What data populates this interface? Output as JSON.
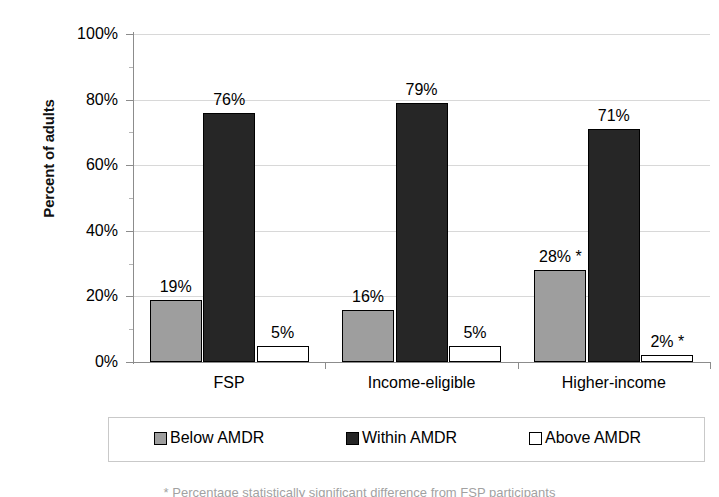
{
  "chart_data": {
    "type": "bar",
    "title": "",
    "xlabel": "",
    "ylabel": "Percent of adults",
    "ylim": [
      0,
      100
    ],
    "ytick_labels": [
      "0%",
      "20%",
      "40%",
      "60%",
      "80%",
      "100%"
    ],
    "ytick_values": [
      0,
      20,
      40,
      60,
      80,
      100
    ],
    "grid": true,
    "legend_position": "bottom",
    "categories": [
      "FSP",
      "Income-eligible",
      "Higher-income"
    ],
    "series": [
      {
        "name": "Below AMDR",
        "color": "#9e9e9e",
        "values": [
          19,
          16,
          28
        ],
        "labels": [
          "19%",
          "16%",
          "28% *"
        ]
      },
      {
        "name": "Within AMDR",
        "color": "#262626",
        "values": [
          76,
          79,
          71
        ],
        "labels": [
          "76%",
          "79%",
          "71%"
        ]
      },
      {
        "name": "Above AMDR",
        "color": "#ffffff",
        "values": [
          5,
          5,
          2
        ],
        "labels": [
          "5%",
          "5%",
          "2% *"
        ]
      }
    ]
  },
  "legend": {
    "items": [
      {
        "label": "Below AMDR"
      },
      {
        "label": "Within AMDR"
      },
      {
        "label": "Above AMDR"
      }
    ]
  },
  "footnote": {
    "text": "* Percentage statistically significant difference from FSP participants"
  }
}
